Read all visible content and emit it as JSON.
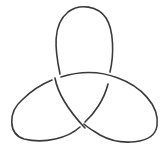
{
  "diagram": {
    "type": "trefoil-knot",
    "stroke_color": "#3a3a3a",
    "background": "#ffffff",
    "crossings": 3
  }
}
